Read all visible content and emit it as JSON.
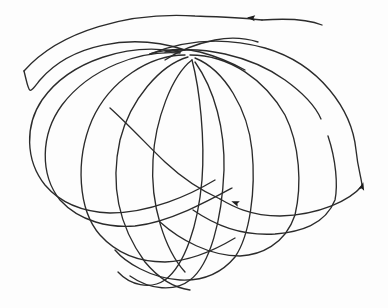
{
  "figure": {
    "colors": {
      "background": "#fdfdfd",
      "stroke": "#2b2b2b",
      "arrow": "#1e1e1e"
    },
    "segments": [
      {
        "name": "outer-top-arc",
        "d": "M 24 71 C 60 30, 130 12, 195 16 C 225 17, 245 18, 262 20"
      },
      {
        "name": "top-right-tail",
        "d": "M 262 20 C 290 18, 310 20, 322 25"
      },
      {
        "name": "loop-1-right",
        "d": "M 150 54 C 185 40, 225 37, 265 48 C 320 64, 352 110, 356 150 C 358 170, 362 180, 362 186"
      },
      {
        "name": "loop-1-return",
        "d": "M 362 186 C 350 200, 320 215, 280 216 C 250 216, 232 206, 220 199"
      },
      {
        "name": "loop-2-right",
        "d": "M 165 52 C 200 45, 250 55, 285 80 C 310 98, 318 112, 321 119"
      },
      {
        "name": "loop-2-right-lower",
        "d": "M 328 136 C 336 160, 338 185, 335 200 C 325 225, 300 232, 275 234 C 240 236, 215 225, 193 210"
      },
      {
        "name": "loop-3-right",
        "d": "M 190 55 C 230 55, 265 80, 285 115 C 300 145, 302 185, 295 215 C 285 245, 260 255, 240 256 C 210 256, 180 240, 160 222"
      },
      {
        "name": "loop-4-right",
        "d": "M 195 58 C 225 70, 248 110, 252 150 C 256 190, 250 235, 235 257 C 220 275, 200 281, 180 280 C 150 278, 125 262, 115 250"
      },
      {
        "name": "loop-5-right",
        "d": "M 195 62 C 215 90, 225 130, 224 170 C 222 220, 210 265, 190 280 C 175 292, 150 290, 130 276"
      },
      {
        "name": "loop-6-right",
        "d": "M 192 60 C 200 90, 205 140, 202 180 C 198 225, 185 265, 165 280 C 150 290, 130 285, 118 272"
      },
      {
        "name": "loop-6-left",
        "d": "M 192 60 C 172 75, 155 120, 153 160 C 150 205, 165 250, 185 272"
      },
      {
        "name": "loop-5-left",
        "d": "M 188 57 C 160 65, 130 100, 120 140 C 110 185, 118 225, 145 262 C 160 280, 175 288, 190 290"
      },
      {
        "name": "loop-4-left",
        "d": "M 185 55 C 150 55, 110 80, 92 120 C 75 160, 78 210, 100 235 C 118 255, 140 262, 165 262 C 190 261, 215 250, 235 238"
      },
      {
        "name": "loop-3-left",
        "d": "M 180 53 C 140 50, 90 68, 62 105 C 40 135, 40 175, 60 200 C 80 222, 110 228, 135 226 C 170 222, 210 200, 232 188"
      },
      {
        "name": "loop-2-left",
        "d": "M 180 52 C 130 42, 70 60, 42 100 C 25 125, 25 160, 45 185 C 62 205, 85 212, 110 213 C 150 213, 190 195, 215 180"
      },
      {
        "name": "loop-1-left",
        "d": "M 185 50 C 130 32, 70 45, 40 80 C 28 95, 30 95, 24 71"
      },
      {
        "name": "lower-arrow-run",
        "d": "M 220 199 C 200 190, 180 176, 165 162 C 150 148, 130 126, 110 108"
      },
      {
        "name": "cusp-weave-a",
        "d": "M 150 54 C 170 48, 185 48, 200 52 C 215 56, 230 62, 245 70"
      },
      {
        "name": "cusp-weave-b",
        "d": "M 165 60 C 180 50, 195 44, 215 40 C 230 37, 245 38, 258 42"
      }
    ],
    "arrows": [
      {
        "name": "arrow-top",
        "x": 252,
        "y": 18,
        "angle": 185
      },
      {
        "name": "arrow-lower-middle",
        "x": 236,
        "y": 203,
        "angle": 200
      },
      {
        "name": "arrow-right",
        "x": 362,
        "y": 187,
        "angle": -75
      }
    ],
    "gap": {
      "x": 322,
      "y": 122,
      "note": "small break in one curve near right side"
    }
  }
}
